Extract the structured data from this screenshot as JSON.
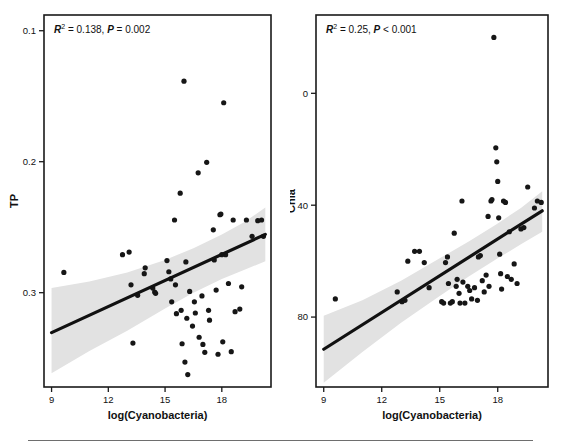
{
  "figure": {
    "panels": [
      "left",
      "right"
    ],
    "footer_rule": true
  },
  "panel_left": {
    "annotation": {
      "r2_symbol": "R",
      "r2_exp": "2",
      "r2_text": " = 0.138, ",
      "p_symbol": "P",
      "p_text": " = 0.002",
      "full": "R2 = 0.138, P = 0.002"
    },
    "ylabel": "TP",
    "xlabel": "log(Cyanobacteria)",
    "yticks": [
      "0.3",
      "0.2",
      "0.1"
    ],
    "xticks": [
      "9",
      "12",
      "15",
      "18"
    ]
  },
  "panel_right": {
    "annotation": {
      "r2_symbol": "R",
      "r2_exp": "2",
      "r2_text": " = 0.25, ",
      "p_symbol": "P",
      "p_text": " < 0.001",
      "full": "R2 = 0.25, P < 0.001"
    },
    "ylabel": "Chla",
    "xlabel": "log(Cyanobacteria)",
    "yticks": [
      "80",
      "40",
      "0"
    ],
    "xticks": [
      "9",
      "12",
      "15",
      "18"
    ]
  },
  "chart_data": [
    {
      "type": "scatter",
      "panel": "left",
      "title": "",
      "xlabel": "log(Cyanobacteria)",
      "ylabel": "TP",
      "xlim": [
        8.6,
        20.6
      ],
      "ylim": [
        0.028,
        0.312
      ],
      "xticks": [
        9,
        12,
        15,
        18
      ],
      "yticks": [
        0.1,
        0.2,
        0.3
      ],
      "grid": false,
      "legend": null,
      "annotations": [
        "R^2 = 0.138, P = 0.002"
      ],
      "stats": {
        "r_squared": 0.138,
        "p_value": 0.002
      },
      "fit_line": {
        "type": "linear",
        "x": [
          9.0,
          20.3
        ],
        "y": [
          0.0695,
          0.1445
        ],
        "slope": 0.00664,
        "intercept": 0.00977,
        "color": "#111111"
      },
      "confidence_band": {
        "label": "95% CI",
        "color": "#e2e2e2",
        "x": [
          9.0,
          11.0,
          13.0,
          15.0,
          16.5,
          18.0,
          19.2,
          20.3
        ],
        "lower": [
          0.0385,
          0.0555,
          0.071,
          0.088,
          0.1,
          0.1105,
          0.1175,
          0.124
        ],
        "upper": [
          0.1035,
          0.1085,
          0.1155,
          0.125,
          0.134,
          0.1445,
          0.154,
          0.165
        ]
      },
      "points": [
        {
          "x": 9.65,
          "y": 0.1155
        },
        {
          "x": 12.75,
          "y": 0.129
        },
        {
          "x": 13.1,
          "y": 0.131
        },
        {
          "x": 13.2,
          "y": 0.106
        },
        {
          "x": 13.3,
          "y": 0.0615
        },
        {
          "x": 13.55,
          "y": 0.098
        },
        {
          "x": 13.9,
          "y": 0.1145
        },
        {
          "x": 13.95,
          "y": 0.119
        },
        {
          "x": 14.35,
          "y": 0.1035
        },
        {
          "x": 14.45,
          "y": 0.1005
        },
        {
          "x": 14.5,
          "y": 0.0995
        },
        {
          "x": 15.1,
          "y": 0.1245
        },
        {
          "x": 15.2,
          "y": 0.116
        },
        {
          "x": 15.3,
          "y": 0.1105
        },
        {
          "x": 15.35,
          "y": 0.093
        },
        {
          "x": 15.5,
          "y": 0.1555
        },
        {
          "x": 15.55,
          "y": 0.106
        },
        {
          "x": 15.6,
          "y": 0.084
        },
        {
          "x": 15.8,
          "y": 0.176
        },
        {
          "x": 15.85,
          "y": 0.0865
        },
        {
          "x": 15.9,
          "y": 0.061
        },
        {
          "x": 16.0,
          "y": 0.2615
        },
        {
          "x": 16.05,
          "y": 0.047
        },
        {
          "x": 16.1,
          "y": 0.1235
        },
        {
          "x": 16.15,
          "y": 0.0805
        },
        {
          "x": 16.2,
          "y": 0.0375
        },
        {
          "x": 16.3,
          "y": 0.101
        },
        {
          "x": 16.45,
          "y": 0.0745
        },
        {
          "x": 16.55,
          "y": 0.093
        },
        {
          "x": 16.6,
          "y": 0.0845
        },
        {
          "x": 16.75,
          "y": 0.1915
        },
        {
          "x": 16.8,
          "y": 0.066
        },
        {
          "x": 16.95,
          "y": 0.0975
        },
        {
          "x": 17.0,
          "y": 0.0605
        },
        {
          "x": 17.1,
          "y": 0.0545
        },
        {
          "x": 17.2,
          "y": 0.1995
        },
        {
          "x": 17.3,
          "y": 0.0865
        },
        {
          "x": 17.35,
          "y": 0.079
        },
        {
          "x": 17.55,
          "y": 0.148
        },
        {
          "x": 17.6,
          "y": 0.125
        },
        {
          "x": 17.7,
          "y": 0.102
        },
        {
          "x": 17.8,
          "y": 0.053
        },
        {
          "x": 17.9,
          "y": 0.1595
        },
        {
          "x": 17.95,
          "y": 0.16
        },
        {
          "x": 18.0,
          "y": 0.129
        },
        {
          "x": 18.05,
          "y": 0.0625
        },
        {
          "x": 18.1,
          "y": 0.245
        },
        {
          "x": 18.2,
          "y": 0.129
        },
        {
          "x": 18.35,
          "y": 0.107
        },
        {
          "x": 18.5,
          "y": 0.055
        },
        {
          "x": 18.6,
          "y": 0.1555
        },
        {
          "x": 18.7,
          "y": 0.0855
        },
        {
          "x": 18.95,
          "y": 0.0875
        },
        {
          "x": 19.05,
          "y": 0.1045
        },
        {
          "x": 19.3,
          "y": 0.1555
        },
        {
          "x": 19.6,
          "y": 0.143
        },
        {
          "x": 19.9,
          "y": 0.155
        },
        {
          "x": 20.1,
          "y": 0.1555
        },
        {
          "x": 20.2,
          "y": 0.143
        }
      ]
    },
    {
      "type": "scatter",
      "panel": "right",
      "title": "",
      "xlabel": "log(Cyanobacteria)",
      "ylabel": "Chla",
      "xlim": [
        8.6,
        20.6
      ],
      "ylim": [
        -25,
        108
      ],
      "xticks": [
        9,
        12,
        15,
        18
      ],
      "yticks": [
        0,
        40,
        80
      ],
      "grid": false,
      "legend": null,
      "annotations": [
        "R^2 = 0.25, P < 0.001"
      ],
      "stats": {
        "r_squared": 0.25,
        "p_value": 0.001
      },
      "fit_line": {
        "type": "linear",
        "x": [
          9.0,
          20.3
        ],
        "y": [
          -11.5,
          38.0
        ],
        "slope": 4.38,
        "intercept": -51.0,
        "color": "#111111"
      },
      "confidence_band": {
        "label": "95% CI",
        "color": "#e2e2e2",
        "x": [
          9.0,
          11.0,
          13.0,
          15.0,
          16.5,
          18.0,
          19.2,
          20.3
        ],
        "lower": [
          -23.5,
          -12.5,
          -2.0,
          7.5,
          14.5,
          21.0,
          26.0,
          30.5
        ],
        "upper": [
          0.5,
          6.0,
          13.0,
          21.0,
          27.0,
          33.5,
          39.0,
          45.0
        ]
      },
      "points": [
        {
          "x": 9.6,
          "y": 6.5
        },
        {
          "x": 12.8,
          "y": 9.0
        },
        {
          "x": 13.05,
          "y": 5.5
        },
        {
          "x": 13.2,
          "y": 6.0
        },
        {
          "x": 13.35,
          "y": 20.0
        },
        {
          "x": 13.7,
          "y": 23.5
        },
        {
          "x": 13.95,
          "y": 23.5
        },
        {
          "x": 14.2,
          "y": 19.5
        },
        {
          "x": 14.45,
          "y": 10.5
        },
        {
          "x": 15.1,
          "y": 5.5
        },
        {
          "x": 15.2,
          "y": 5.0
        },
        {
          "x": 15.3,
          "y": 19.5
        },
        {
          "x": 15.4,
          "y": 21.5
        },
        {
          "x": 15.45,
          "y": 12.0
        },
        {
          "x": 15.55,
          "y": 5.0
        },
        {
          "x": 15.65,
          "y": 5.5
        },
        {
          "x": 15.75,
          "y": 30.0
        },
        {
          "x": 15.85,
          "y": 11.0
        },
        {
          "x": 15.9,
          "y": 13.5
        },
        {
          "x": 16.0,
          "y": 8.5
        },
        {
          "x": 16.05,
          "y": 5.0
        },
        {
          "x": 16.15,
          "y": 41.5
        },
        {
          "x": 16.2,
          "y": 12.5
        },
        {
          "x": 16.3,
          "y": 5.0
        },
        {
          "x": 16.45,
          "y": 11.0
        },
        {
          "x": 16.55,
          "y": 9.5
        },
        {
          "x": 16.65,
          "y": 6.5
        },
        {
          "x": 16.8,
          "y": 10.5
        },
        {
          "x": 16.95,
          "y": 6.0
        },
        {
          "x": 17.0,
          "y": 21.5
        },
        {
          "x": 17.1,
          "y": 22.0
        },
        {
          "x": 17.2,
          "y": 13.0
        },
        {
          "x": 17.3,
          "y": 9.0
        },
        {
          "x": 17.4,
          "y": 15.0
        },
        {
          "x": 17.5,
          "y": 36.0
        },
        {
          "x": 17.55,
          "y": 11.0
        },
        {
          "x": 17.65,
          "y": 41.5
        },
        {
          "x": 17.7,
          "y": 42.0
        },
        {
          "x": 17.8,
          "y": 100.0
        },
        {
          "x": 17.9,
          "y": 60.5
        },
        {
          "x": 17.95,
          "y": 55.5
        },
        {
          "x": 18.0,
          "y": 48.5
        },
        {
          "x": 18.05,
          "y": 35.5
        },
        {
          "x": 18.1,
          "y": 22.5
        },
        {
          "x": 18.15,
          "y": 15.5
        },
        {
          "x": 18.2,
          "y": 10.0
        },
        {
          "x": 18.3,
          "y": 41.5
        },
        {
          "x": 18.4,
          "y": 41.0
        },
        {
          "x": 18.5,
          "y": 14.5
        },
        {
          "x": 18.6,
          "y": 30.5
        },
        {
          "x": 18.7,
          "y": 13.5
        },
        {
          "x": 18.85,
          "y": 19.0
        },
        {
          "x": 19.0,
          "y": 12.0
        },
        {
          "x": 19.2,
          "y": 31.5
        },
        {
          "x": 19.35,
          "y": 32.0
        },
        {
          "x": 19.55,
          "y": 46.5
        },
        {
          "x": 19.9,
          "y": 39.0
        },
        {
          "x": 20.05,
          "y": 41.5
        },
        {
          "x": 20.25,
          "y": 41.0
        }
      ]
    }
  ]
}
